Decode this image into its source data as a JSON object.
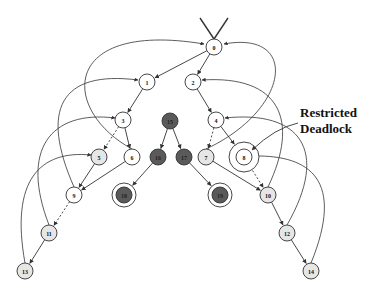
{
  "annotation": {
    "line1": "Restricted",
    "line2": "Deadlock",
    "x": 300,
    "y1": 117,
    "y2": 133,
    "arrow_from": [
      298,
      123
    ],
    "arrow_to": [
      252,
      150
    ]
  },
  "colors": {
    "white_fill": "#ffffff",
    "light_fill": "#e6e6e6",
    "dark_fill": "#5a5a5a",
    "stroke": "#333333"
  },
  "nodes": [
    {
      "id": "0",
      "x": 214,
      "y": 47,
      "fill": "white"
    },
    {
      "id": "1",
      "x": 147,
      "y": 82,
      "fill": "white"
    },
    {
      "id": "2",
      "x": 193,
      "y": 82,
      "fill": "white"
    },
    {
      "id": "3",
      "x": 123,
      "y": 120,
      "fill": "white"
    },
    {
      "id": "4",
      "x": 216,
      "y": 120,
      "fill": "white"
    },
    {
      "id": "5",
      "x": 99,
      "y": 157,
      "fill": "light"
    },
    {
      "id": "6",
      "x": 132,
      "y": 157,
      "fill": "white"
    },
    {
      "id": "7",
      "x": 206,
      "y": 157,
      "fill": "light"
    },
    {
      "id": "8",
      "x": 244,
      "y": 157,
      "fill": "white",
      "ring": true,
      "ring_r": 15
    },
    {
      "id": "9",
      "x": 74,
      "y": 195,
      "fill": "white"
    },
    {
      "id": "10",
      "x": 268,
      "y": 195,
      "fill": "light"
    },
    {
      "id": "11",
      "x": 49,
      "y": 233,
      "fill": "light"
    },
    {
      "id": "12",
      "x": 287,
      "y": 233,
      "fill": "light"
    },
    {
      "id": "13",
      "x": 25,
      "y": 271,
      "fill": "light"
    },
    {
      "id": "14",
      "x": 311,
      "y": 271,
      "fill": "light"
    },
    {
      "id": "15",
      "x": 170,
      "y": 121,
      "fill": "dark"
    },
    {
      "id": "16",
      "x": 158,
      "y": 157,
      "fill": "dark"
    },
    {
      "id": "17",
      "x": 184,
      "y": 157,
      "fill": "dark"
    },
    {
      "id": "18",
      "x": 124,
      "y": 195,
      "fill": "dark",
      "ring": true,
      "ring_r": 12
    },
    {
      "id": "19",
      "x": 220,
      "y": 195,
      "fill": "dark",
      "ring": true,
      "ring_r": 12
    }
  ],
  "edges": [
    {
      "from": "0",
      "to": "1",
      "style": "solid"
    },
    {
      "from": "0",
      "to": "2",
      "style": "solid"
    },
    {
      "from": "1",
      "to": "3",
      "style": "solid"
    },
    {
      "from": "2",
      "to": "4",
      "style": "solid"
    },
    {
      "from": "3",
      "to": "5",
      "style": "dashed"
    },
    {
      "from": "3",
      "to": "6",
      "style": "solid"
    },
    {
      "from": "4",
      "to": "7",
      "style": "dashed"
    },
    {
      "from": "4",
      "to": "8",
      "style": "solid"
    },
    {
      "from": "5",
      "to": "9",
      "style": "solid"
    },
    {
      "from": "6",
      "to": "9",
      "style": "solid"
    },
    {
      "from": "7",
      "to": "10",
      "style": "solid"
    },
    {
      "from": "8",
      "to": "10",
      "style": "dashed"
    },
    {
      "from": "9",
      "to": "11",
      "style": "dashed"
    },
    {
      "from": "10",
      "to": "12",
      "style": "solid"
    },
    {
      "from": "11",
      "to": "13",
      "style": "solid"
    },
    {
      "from": "12",
      "to": "14",
      "style": "solid"
    },
    {
      "from": "15",
      "to": "16",
      "style": "solid"
    },
    {
      "from": "15",
      "to": "17",
      "style": "solid"
    },
    {
      "from": "16",
      "to": "18",
      "style": "solid"
    },
    {
      "from": "17",
      "to": "19",
      "style": "solid"
    }
  ],
  "back_arcs": [
    {
      "d": "M132 149 C 60 110, 60 20, 204 44"
    },
    {
      "d": "M74 187 C 40 110, 60 70, 138 80"
    },
    {
      "d": "M49 225 C 20 150, 50 110, 115 118"
    },
    {
      "d": "M25 263 C 10 180, 40 150, 91 155"
    },
    {
      "d": "M206 149 C 290 110, 300 30, 224 44"
    },
    {
      "d": "M268 187 C 300 120, 280 75, 202 80"
    },
    {
      "d": "M287 225 C 330 150, 300 110, 225 118"
    },
    {
      "d": "M311 263 C 345 180, 310 155, 254 156"
    }
  ],
  "entry": {
    "left": [
      200,
      18
    ],
    "right": [
      228,
      18
    ],
    "tip": [
      214,
      39
    ]
  }
}
